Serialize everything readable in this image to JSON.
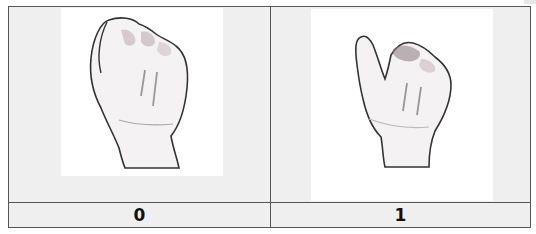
{
  "table": {
    "columns": [
      {
        "image": {
          "icon": "closed-fist-hand-sign-icon",
          "description": "Closed fist hand sign"
        },
        "label": "0"
      },
      {
        "image": {
          "icon": "thumb-raised-fist-hand-sign-icon",
          "description": "Fist with thumb raised hand sign"
        },
        "label": "1"
      }
    ]
  },
  "colors": {
    "border": "#555555",
    "cell_background": "#efefef",
    "image_background": "#ffffff"
  }
}
